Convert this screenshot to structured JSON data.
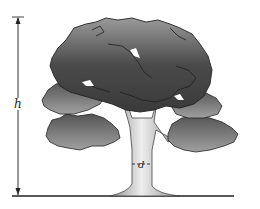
{
  "diagram": {
    "labels": {
      "height": "h",
      "diameter": "d"
    },
    "colors": {
      "foliage_dark": "#3f3f3f",
      "foliage_light": "#9a9a9a",
      "trunk_light": "#e6e6e6",
      "trunk_dark": "#8c8c8c",
      "lines": "#222222",
      "background": "#ffffff"
    }
  }
}
